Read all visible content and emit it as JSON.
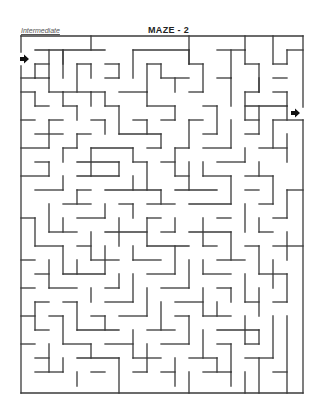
{
  "header": {
    "difficulty_label": "Intermediate",
    "title": "MAZE - 2"
  },
  "maze": {
    "wall_color": "#3a3a3a",
    "wall_width": 1.3,
    "bounds": {
      "left": 21,
      "top": 36,
      "right": 303,
      "bottom": 393
    },
    "entrance": {
      "x": 24,
      "y": 59,
      "direction": "right",
      "icon": "arrow-right-icon",
      "color": "#111111"
    },
    "exit": {
      "x": 295,
      "y": 113,
      "direction": "right",
      "icon": "arrow-right-icon",
      "color": "#111111"
    },
    "segments": [
      [
        21,
        36,
        303,
        36
      ],
      [
        21,
        36,
        21,
        52
      ],
      [
        21,
        66,
        21,
        393
      ],
      [
        21,
        393,
        303,
        393
      ],
      [
        303,
        36,
        303,
        107
      ],
      [
        303,
        120,
        303,
        393
      ],
      [
        91,
        36,
        91,
        50
      ],
      [
        189,
        36,
        189,
        64
      ],
      [
        245,
        36,
        245,
        50
      ],
      [
        273,
        36,
        273,
        64
      ],
      [
        35,
        50,
        105,
        50
      ],
      [
        49,
        50,
        49,
        78
      ],
      [
        63,
        50,
        63,
        64
      ],
      [
        63,
        50,
        63,
        78
      ],
      [
        133,
        50,
        133,
        78
      ],
      [
        133,
        50,
        189,
        50
      ],
      [
        189,
        50,
        189,
        64
      ],
      [
        217,
        50,
        245,
        50
      ],
      [
        231,
        50,
        231,
        78
      ],
      [
        245,
        50,
        245,
        64
      ],
      [
        287,
        50,
        303,
        50
      ],
      [
        287,
        50,
        287,
        64
      ],
      [
        35,
        64,
        35,
        78
      ],
      [
        35,
        78,
        49,
        78
      ],
      [
        35,
        64,
        49,
        64
      ],
      [
        77,
        64,
        77,
        92
      ],
      [
        77,
        64,
        91,
        64
      ],
      [
        91,
        64,
        91,
        78
      ],
      [
        105,
        64,
        119,
        64
      ],
      [
        119,
        64,
        119,
        78
      ],
      [
        147,
        64,
        147,
        92
      ],
      [
        147,
        64,
        161,
        64
      ],
      [
        161,
        64,
        161,
        78
      ],
      [
        189,
        64,
        203,
        64
      ],
      [
        203,
        64,
        203,
        92
      ],
      [
        245,
        64,
        259,
        64
      ],
      [
        259,
        64,
        259,
        92
      ],
      [
        273,
        64,
        287,
        64
      ],
      [
        21,
        78,
        35,
        78
      ],
      [
        49,
        78,
        49,
        92
      ],
      [
        49,
        92,
        63,
        92
      ],
      [
        63,
        92,
        63,
        106
      ],
      [
        63,
        92,
        91,
        92
      ],
      [
        105,
        78,
        119,
        78
      ],
      [
        161,
        78,
        189,
        78
      ],
      [
        175,
        78,
        175,
        92
      ],
      [
        217,
        78,
        231,
        78
      ],
      [
        231,
        78,
        231,
        106
      ],
      [
        273,
        78,
        287,
        78
      ],
      [
        21,
        92,
        35,
        92
      ],
      [
        35,
        92,
        35,
        106
      ],
      [
        91,
        92,
        91,
        106
      ],
      [
        91,
        92,
        105,
        92
      ],
      [
        105,
        92,
        105,
        106
      ],
      [
        119,
        92,
        147,
        92
      ],
      [
        147,
        92,
        147,
        106
      ],
      [
        189,
        92,
        203,
        92
      ],
      [
        245,
        92,
        245,
        120
      ],
      [
        245,
        92,
        259,
        92
      ],
      [
        259,
        78,
        259,
        92
      ],
      [
        273,
        92,
        287,
        92
      ],
      [
        287,
        92,
        287,
        106
      ],
      [
        35,
        106,
        49,
        106
      ],
      [
        63,
        106,
        77,
        106
      ],
      [
        77,
        106,
        77,
        120
      ],
      [
        105,
        106,
        119,
        106
      ],
      [
        119,
        106,
        119,
        134
      ],
      [
        147,
        106,
        175,
        106
      ],
      [
        175,
        106,
        175,
        120
      ],
      [
        203,
        106,
        217,
        106
      ],
      [
        217,
        106,
        217,
        134
      ],
      [
        245,
        106,
        287,
        106
      ],
      [
        259,
        106,
        259,
        134
      ],
      [
        287,
        106,
        287,
        120
      ],
      [
        21,
        120,
        35,
        120
      ],
      [
        49,
        120,
        49,
        148
      ],
      [
        49,
        120,
        63,
        120
      ],
      [
        91,
        120,
        105,
        120
      ],
      [
        105,
        120,
        105,
        134
      ],
      [
        133,
        120,
        147,
        120
      ],
      [
        147,
        120,
        147,
        134
      ],
      [
        161,
        120,
        175,
        120
      ],
      [
        189,
        120,
        189,
        148
      ],
      [
        189,
        120,
        203,
        120
      ],
      [
        231,
        120,
        231,
        148
      ],
      [
        245,
        120,
        259,
        120
      ],
      [
        273,
        120,
        273,
        148
      ],
      [
        273,
        120,
        303,
        120
      ],
      [
        35,
        134,
        63,
        134
      ],
      [
        77,
        134,
        77,
        148
      ],
      [
        77,
        134,
        91,
        134
      ],
      [
        119,
        134,
        161,
        134
      ],
      [
        161,
        134,
        161,
        148
      ],
      [
        203,
        134,
        217,
        134
      ],
      [
        245,
        134,
        259,
        134
      ],
      [
        287,
        134,
        287,
        162
      ],
      [
        21,
        148,
        49,
        148
      ],
      [
        63,
        148,
        63,
        162
      ],
      [
        63,
        148,
        77,
        148
      ],
      [
        91,
        148,
        91,
        176
      ],
      [
        91,
        148,
        133,
        148
      ],
      [
        133,
        148,
        133,
        162
      ],
      [
        147,
        148,
        161,
        148
      ],
      [
        175,
        148,
        175,
        176
      ],
      [
        175,
        148,
        189,
        148
      ],
      [
        203,
        148,
        231,
        148
      ],
      [
        245,
        148,
        245,
        162
      ],
      [
        259,
        148,
        287,
        148
      ],
      [
        35,
        162,
        49,
        162
      ],
      [
        49,
        162,
        49,
        176
      ],
      [
        77,
        162,
        119,
        162
      ],
      [
        119,
        162,
        119,
        176
      ],
      [
        133,
        162,
        147,
        162
      ],
      [
        147,
        162,
        147,
        190
      ],
      [
        161,
        162,
        175,
        162
      ],
      [
        189,
        162,
        189,
        190
      ],
      [
        203,
        162,
        203,
        176
      ],
      [
        217,
        162,
        245,
        162
      ],
      [
        259,
        162,
        259,
        176
      ],
      [
        21,
        176,
        49,
        176
      ],
      [
        63,
        176,
        63,
        190
      ],
      [
        77,
        176,
        119,
        176
      ],
      [
        133,
        176,
        133,
        190
      ],
      [
        175,
        176,
        189,
        176
      ],
      [
        203,
        176,
        231,
        176
      ],
      [
        231,
        176,
        231,
        204
      ],
      [
        245,
        176,
        273,
        176
      ],
      [
        273,
        176,
        273,
        204
      ],
      [
        35,
        190,
        63,
        190
      ],
      [
        77,
        190,
        77,
        204
      ],
      [
        77,
        190,
        91,
        190
      ],
      [
        105,
        190,
        161,
        190
      ],
      [
        161,
        190,
        161,
        204
      ],
      [
        175,
        190,
        217,
        190
      ],
      [
        245,
        190,
        259,
        190
      ],
      [
        287,
        190,
        303,
        190
      ],
      [
        287,
        190,
        287,
        218
      ],
      [
        49,
        204,
        49,
        232
      ],
      [
        63,
        204,
        91,
        204
      ],
      [
        105,
        204,
        105,
        218
      ],
      [
        119,
        204,
        133,
        204
      ],
      [
        133,
        204,
        133,
        218
      ],
      [
        147,
        204,
        175,
        204
      ],
      [
        189,
        204,
        231,
        204
      ],
      [
        245,
        204,
        245,
        232
      ],
      [
        259,
        204,
        273,
        204
      ],
      [
        21,
        218,
        35,
        218
      ],
      [
        35,
        218,
        35,
        246
      ],
      [
        63,
        218,
        63,
        232
      ],
      [
        77,
        218,
        105,
        218
      ],
      [
        119,
        218,
        119,
        246
      ],
      [
        147,
        218,
        147,
        246
      ],
      [
        147,
        218,
        161,
        218
      ],
      [
        175,
        218,
        175,
        232
      ],
      [
        203,
        218,
        203,
        246
      ],
      [
        217,
        218,
        231,
        218
      ],
      [
        259,
        218,
        259,
        232
      ],
      [
        273,
        218,
        287,
        218
      ],
      [
        49,
        232,
        77,
        232
      ],
      [
        91,
        232,
        91,
        260
      ],
      [
        105,
        232,
        147,
        232
      ],
      [
        161,
        232,
        175,
        232
      ],
      [
        189,
        232,
        231,
        232
      ],
      [
        231,
        232,
        231,
        260
      ],
      [
        259,
        232,
        273,
        232
      ],
      [
        287,
        232,
        287,
        260
      ],
      [
        35,
        246,
        63,
        246
      ],
      [
        63,
        246,
        63,
        274
      ],
      [
        77,
        246,
        91,
        246
      ],
      [
        105,
        246,
        105,
        274
      ],
      [
        133,
        246,
        133,
        260
      ],
      [
        147,
        246,
        189,
        246
      ],
      [
        175,
        246,
        175,
        274
      ],
      [
        203,
        246,
        217,
        246
      ],
      [
        245,
        246,
        259,
        246
      ],
      [
        259,
        246,
        259,
        274
      ],
      [
        273,
        246,
        303,
        246
      ],
      [
        21,
        260,
        35,
        260
      ],
      [
        49,
        260,
        49,
        288
      ],
      [
        77,
        260,
        77,
        274
      ],
      [
        91,
        260,
        119,
        260
      ],
      [
        133,
        260,
        161,
        260
      ],
      [
        189,
        260,
        189,
        288
      ],
      [
        203,
        260,
        203,
        274
      ],
      [
        217,
        260,
        245,
        260
      ],
      [
        273,
        260,
        273,
        288
      ],
      [
        35,
        274,
        49,
        274
      ],
      [
        63,
        274,
        105,
        274
      ],
      [
        119,
        274,
        119,
        288
      ],
      [
        133,
        274,
        133,
        302
      ],
      [
        147,
        274,
        175,
        274
      ],
      [
        203,
        274,
        231,
        274
      ],
      [
        245,
        274,
        245,
        302
      ],
      [
        259,
        274,
        287,
        274
      ],
      [
        287,
        274,
        287,
        302
      ],
      [
        21,
        288,
        35,
        288
      ],
      [
        49,
        288,
        77,
        288
      ],
      [
        91,
        288,
        91,
        302
      ],
      [
        105,
        288,
        119,
        288
      ],
      [
        147,
        288,
        147,
        316
      ],
      [
        161,
        288,
        189,
        288
      ],
      [
        203,
        288,
        203,
        316
      ],
      [
        217,
        288,
        231,
        288
      ],
      [
        231,
        288,
        231,
        302
      ],
      [
        259,
        288,
        259,
        316
      ],
      [
        35,
        302,
        35,
        330
      ],
      [
        35,
        302,
        49,
        302
      ],
      [
        63,
        302,
        77,
        302
      ],
      [
        77,
        302,
        77,
        330
      ],
      [
        105,
        302,
        133,
        302
      ],
      [
        161,
        302,
        161,
        330
      ],
      [
        175,
        302,
        203,
        302
      ],
      [
        217,
        302,
        217,
        316
      ],
      [
        245,
        302,
        259,
        302
      ],
      [
        273,
        302,
        287,
        302
      ],
      [
        21,
        316,
        35,
        316
      ],
      [
        49,
        316,
        63,
        316
      ],
      [
        63,
        316,
        63,
        344
      ],
      [
        91,
        316,
        105,
        316
      ],
      [
        105,
        316,
        105,
        330
      ],
      [
        119,
        316,
        147,
        316
      ],
      [
        175,
        316,
        189,
        316
      ],
      [
        189,
        316,
        189,
        344
      ],
      [
        203,
        316,
        231,
        316
      ],
      [
        245,
        316,
        245,
        344
      ],
      [
        273,
        316,
        273,
        358
      ],
      [
        287,
        316,
        287,
        393
      ],
      [
        35,
        330,
        49,
        330
      ],
      [
        77,
        330,
        119,
        330
      ],
      [
        133,
        330,
        133,
        358
      ],
      [
        147,
        330,
        175,
        330
      ],
      [
        203,
        330,
        203,
        358
      ],
      [
        217,
        330,
        259,
        330
      ],
      [
        259,
        330,
        259,
        344
      ],
      [
        21,
        344,
        35,
        344
      ],
      [
        49,
        344,
        49,
        372
      ],
      [
        63,
        344,
        91,
        344
      ],
      [
        91,
        344,
        91,
        358
      ],
      [
        105,
        344,
        133,
        344
      ],
      [
        147,
        344,
        147,
        372
      ],
      [
        161,
        344,
        189,
        344
      ],
      [
        217,
        344,
        231,
        344
      ],
      [
        231,
        344,
        231,
        372
      ],
      [
        245,
        344,
        259,
        344
      ],
      [
        35,
        358,
        49,
        358
      ],
      [
        63,
        358,
        63,
        372
      ],
      [
        77,
        358,
        119,
        358
      ],
      [
        119,
        358,
        119,
        393
      ],
      [
        133,
        358,
        161,
        358
      ],
      [
        175,
        358,
        175,
        386
      ],
      [
        189,
        358,
        217,
        358
      ],
      [
        217,
        358,
        217,
        372
      ],
      [
        245,
        358,
        273,
        358
      ],
      [
        259,
        358,
        259,
        393
      ],
      [
        35,
        372,
        63,
        372
      ],
      [
        77,
        372,
        77,
        386
      ],
      [
        91,
        372,
        105,
        372
      ],
      [
        133,
        372,
        147,
        372
      ],
      [
        161,
        372,
        175,
        372
      ],
      [
        189,
        372,
        189,
        393
      ],
      [
        203,
        372,
        231,
        372
      ],
      [
        231,
        372,
        231,
        386
      ],
      [
        245,
        372,
        245,
        393
      ],
      [
        273,
        372,
        287,
        372
      ]
    ]
  }
}
